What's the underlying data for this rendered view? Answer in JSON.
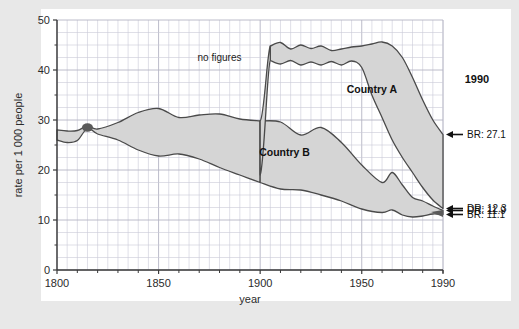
{
  "figure": {
    "background_color": "#e8e8e8",
    "panel_color": "#ffffff",
    "band_fill": "#d5d5d5",
    "band_stroke": "#4a4a4a",
    "grid_color": "#c9c9d6",
    "axis_color": "#3a3a3a",
    "pinch_color": "#5a5a5a"
  },
  "chart_data": {
    "type": "area",
    "title": "",
    "xlabel": "year",
    "ylabel": "rate per 1 000 people",
    "xlim": [
      1800,
      1990
    ],
    "ylim": [
      0,
      50
    ],
    "xticks": [
      1800,
      1850,
      1900,
      1950,
      1990
    ],
    "xtick_labels": [
      "1800",
      "1850",
      "1900",
      "1950",
      "1990"
    ],
    "yticks": [
      0,
      10,
      20,
      30,
      40,
      50
    ],
    "ytick_labels": [
      "0",
      "10",
      "20",
      "30",
      "40",
      "50"
    ],
    "minor_grid": true,
    "minor_grid_x_step": 5,
    "minor_grid_y_step": 2.5,
    "legend_position": "inline-annotations",
    "series": [
      {
        "name": "Country A birth rate",
        "role": "upper-bound-of-band",
        "band": "Country A",
        "x": [
          1800,
          1805,
          1810,
          1815,
          1820,
          1830,
          1840,
          1850,
          1860,
          1870,
          1880,
          1890,
          1900,
          1905,
          1910,
          1915,
          1920,
          1925,
          1930,
          1935,
          1940,
          1945,
          1950,
          1955,
          1960,
          1965,
          1970,
          1975,
          1980,
          1985,
          1990
        ],
        "values": [
          28.0,
          27.8,
          27.9,
          28.8,
          28.2,
          29.5,
          31.5,
          32.3,
          30.5,
          31.0,
          31.2,
          30.2,
          29.8,
          44.8,
          45.5,
          44.2,
          45.0,
          44.3,
          44.8,
          43.9,
          44.2,
          44.6,
          44.8,
          45.2,
          45.6,
          44.8,
          42.5,
          38.5,
          34.0,
          30.0,
          27.1
        ]
      },
      {
        "name": "Country A death rate",
        "role": "lower-bound-of-band",
        "band": "Country A",
        "x": [
          1800,
          1805,
          1810,
          1815,
          1820,
          1830,
          1840,
          1850,
          1860,
          1870,
          1880,
          1890,
          1900,
          1905,
          1910,
          1915,
          1920,
          1925,
          1930,
          1935,
          1940,
          1945,
          1950,
          1955,
          1960,
          1965,
          1970,
          1975,
          1980,
          1985,
          1990
        ],
        "values": [
          26.0,
          25.5,
          25.9,
          28.3,
          27.2,
          26.5,
          25.0,
          24.5,
          24.0,
          22.8,
          23.5,
          21.0,
          19.0,
          41.9,
          41.2,
          41.9,
          41.0,
          41.6,
          41.0,
          41.7,
          41.0,
          41.8,
          40.5,
          35.0,
          30.5,
          26.0,
          22.5,
          19.5,
          16.5,
          14.0,
          12.3
        ]
      },
      {
        "name": "Country B birth rate",
        "role": "upper-bound-of-band",
        "band": "Country B",
        "x": [
          1800,
          1805,
          1810,
          1815,
          1820,
          1830,
          1840,
          1850,
          1860,
          1870,
          1880,
          1890,
          1900,
          1910,
          1920,
          1930,
          1940,
          1950,
          1960,
          1965,
          1970,
          1975,
          1980,
          1985,
          1990
        ],
        "values": [
          28.0,
          27.8,
          27.9,
          28.8,
          28.2,
          29.5,
          31.5,
          32.3,
          30.5,
          31.0,
          31.2,
          30.2,
          29.8,
          29.6,
          27.0,
          28.5,
          25.5,
          21.0,
          17.5,
          19.5,
          17.0,
          14.5,
          13.8,
          12.8,
          11.9
        ]
      },
      {
        "name": "Country B death rate",
        "role": "lower-bound-of-band",
        "band": "Country B",
        "x": [
          1800,
          1805,
          1810,
          1815,
          1820,
          1830,
          1840,
          1850,
          1860,
          1870,
          1880,
          1890,
          1900,
          1910,
          1920,
          1930,
          1940,
          1950,
          1960,
          1965,
          1970,
          1975,
          1980,
          1985,
          1990
        ],
        "values": [
          26.0,
          25.5,
          25.9,
          28.3,
          27.2,
          26.0,
          24.0,
          22.8,
          23.2,
          22.2,
          20.5,
          19.0,
          17.5,
          16.2,
          16.0,
          15.0,
          13.8,
          12.2,
          11.5,
          12.0,
          11.0,
          10.6,
          10.8,
          11.2,
          11.1
        ]
      }
    ],
    "annotations": [
      {
        "id": "no-figures",
        "text": "no figures",
        "x": 1880,
        "y": 42.5
      },
      {
        "id": "country-a",
        "text": "Country A",
        "x": 1955,
        "y": 36.0
      },
      {
        "id": "country-b",
        "text": "Country B",
        "x": 1912,
        "y": 23.5
      },
      {
        "id": "year-1990",
        "text": "1990",
        "x": 1990,
        "y": 38.0
      }
    ],
    "endpoint_callouts": [
      {
        "id": "br-country-a",
        "label": "BR: 27.1",
        "value": 27.1,
        "year": 1990
      },
      {
        "id": "dr-country-a",
        "label": "DR: 12.3",
        "value": 12.3,
        "year": 1990
      },
      {
        "id": "dr-country-b",
        "label": "DR: 11.9",
        "value": 11.9,
        "year": 1990
      },
      {
        "id": "br-country-b",
        "label": "BR: 11.1",
        "value": 11.1,
        "year": 1990
      }
    ]
  }
}
